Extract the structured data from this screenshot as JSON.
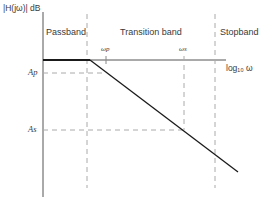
{
  "diagram": {
    "type": "lowpass-filter-specification",
    "y_axis_label": "|H(jω)| dB",
    "x_axis_label": "log₁₀ ω",
    "regions": [
      {
        "label": "Passband"
      },
      {
        "label": "Transition band"
      },
      {
        "label": "Stopband"
      }
    ],
    "frequency_markers": [
      {
        "label": "ωp"
      },
      {
        "label": "ωs"
      }
    ],
    "level_markers": [
      {
        "label": "Ap"
      },
      {
        "label": "As"
      }
    ],
    "colors": {
      "response_line": "#1a1a1a",
      "axis": "#555555",
      "dashed": "#aaaaaa",
      "text": "#3a3a3a"
    }
  }
}
